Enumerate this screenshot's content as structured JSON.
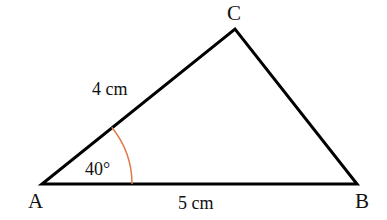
{
  "diagram": {
    "type": "triangle",
    "vertices": {
      "A": {
        "label": "A"
      },
      "B": {
        "label": "B"
      },
      "C": {
        "label": "C"
      }
    },
    "sides": {
      "AC": {
        "label": "4 cm"
      },
      "AB": {
        "label": "5 cm"
      }
    },
    "angle_A": {
      "label": "40°",
      "arc_color": "#e07a4a"
    },
    "stroke_color": "#000000"
  }
}
